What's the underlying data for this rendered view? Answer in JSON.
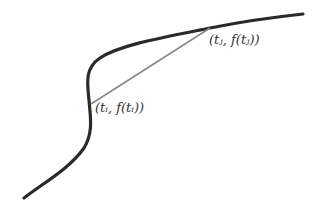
{
  "diagram": {
    "curve_color": "#2a2a2a",
    "secant_color": "#888888",
    "points": {
      "i": {
        "label": "(tᵢ, f(tᵢ))",
        "x": 91,
        "y": 104
      },
      "j": {
        "label": "(tⱼ, f(tⱼ))",
        "x": 210,
        "y": 28
      }
    }
  }
}
